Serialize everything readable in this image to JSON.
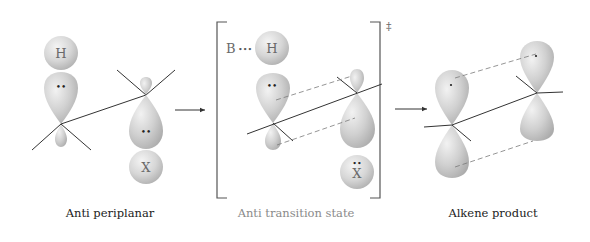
{
  "diagram": {
    "type": "E2 elimination orbital diagram",
    "panels": [
      {
        "id": "anti-periplanar",
        "caption": "Anti periplanar",
        "atoms": {
          "top": "H",
          "bottom": "X"
        },
        "lone_pair_marker": "••"
      },
      {
        "id": "transition-state",
        "caption": "Anti transition state",
        "atoms": {
          "top": "H",
          "bottom": "X"
        },
        "base_label": "B",
        "base_dots": "•••",
        "lone_pair_marker": "••",
        "x_lone_pair": "••",
        "bracket_symbol": "‡"
      },
      {
        "id": "alkene-product",
        "caption": "Alkene product",
        "p_orbital_marker": "•"
      }
    ],
    "arrows": [
      {
        "from": "anti-periplanar",
        "to": "transition-state"
      },
      {
        "from": "transition-state",
        "to": "alkene-product"
      }
    ],
    "colors": {
      "lobe_fill": "#c8c8c8",
      "lobe_highlight": "#efefef",
      "caption_dark": "#222222",
      "caption_muted": "#8a8a8a",
      "line": "#333333"
    }
  }
}
